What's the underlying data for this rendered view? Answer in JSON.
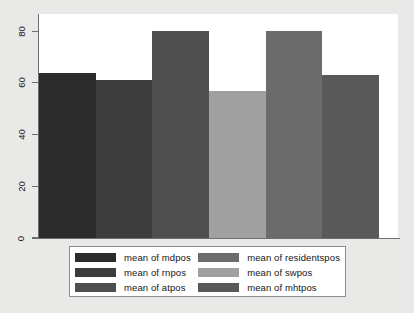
{
  "chart_data": {
    "type": "bar",
    "title": "",
    "subtitle": "",
    "xlabel": "",
    "ylabel": "",
    "ylim": [
      0,
      85
    ],
    "yticks": [
      0,
      20,
      40,
      60,
      80
    ],
    "ytick_labels": [
      "0",
      "20",
      "40",
      "60",
      "80"
    ],
    "grid": false,
    "legend_position": "bottom",
    "categories": [
      "mean of mdpos",
      "mean of rnpos",
      "mean of atpos",
      "mean of swpos",
      "mean of residentspos",
      "mean of mhtpos"
    ],
    "values": [
      64,
      61,
      80,
      57,
      80,
      63
    ],
    "bar_colors": [
      "#2b2b2b",
      "#3d3d3d",
      "#4f4f4f",
      "#a0a0a0",
      "#6b6b6b",
      "#595959"
    ],
    "series": [
      {
        "name": "mean",
        "values": [
          64,
          61,
          80,
          57,
          80,
          63
        ]
      }
    ]
  },
  "axis": {
    "y_ticks": [
      {
        "label": "80",
        "value": 80
      },
      {
        "label": "60",
        "value": 60
      },
      {
        "label": "40",
        "value": 40
      },
      {
        "label": "20",
        "value": 20
      },
      {
        "label": "0",
        "value": 0
      }
    ]
  },
  "legend": {
    "entries": [
      {
        "label": "mean of mdpos",
        "color": "#2b2b2b"
      },
      {
        "label": "mean of residentspos",
        "color": "#6b6b6b"
      },
      {
        "label": "mean of rnpos",
        "color": "#3d3d3d"
      },
      {
        "label": "mean of swpos",
        "color": "#a0a0a0"
      },
      {
        "label": "mean of atpos",
        "color": "#4f4f4f"
      },
      {
        "label": "mean of mhtpos",
        "color": "#595959"
      }
    ]
  },
  "colors": {
    "page_background": "#e9e9e7",
    "plot_background": "#ffffff",
    "axis_line": "#6e6e6e",
    "legend_border": "#8d8d8d",
    "text": "#151515"
  }
}
